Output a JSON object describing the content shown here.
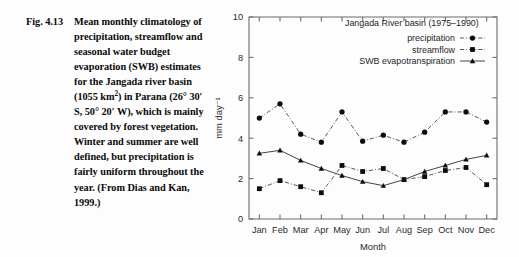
{
  "caption": {
    "figure_number": "Fig. 4.13",
    "text_html": "Mean monthly climatology of precipitation, streamflow and seasonal water budget evaporation (SWB) estimates for the Jangada river basin (1055 km<sup>2</sup>) in Parana (26° 30′ S, 50° 20′ W), which is mainly covered by forest vegetation. Winter and summer are well defined, but precipitation is fairly uniform throughout the year. (From Dias and Kan, 1999.)",
    "text_plain": "Mean monthly climatology of precipitation, streamflow and seasonal water budget evaporation (SWB) estimates for the Jangada river basin (1055 km2) in Parana (26° 30′ S, 50° 20′ W), which is mainly covered by forest vegetation. Winter and summer are well defined, but precipitation is fairly uniform throughout the year. (From Dias and Kan, 1999.)"
  },
  "chart_data": {
    "type": "line",
    "title": "Jangada River basin (1975–1990)",
    "xlabel": "Month",
    "ylabel": "mm day⁻¹",
    "categories": [
      "Jan",
      "Feb",
      "Mar",
      "Apr",
      "May",
      "Jun",
      "Jul",
      "Aug",
      "Sep",
      "Oct",
      "Nov",
      "Dec"
    ],
    "ylim": [
      0,
      10
    ],
    "yticks": [
      0,
      2,
      4,
      6,
      8,
      10
    ],
    "yticklabels": [
      "0",
      "2",
      "4",
      "6",
      "8",
      "10"
    ],
    "grid": false,
    "legend_position": "top-right",
    "series": [
      {
        "name": "precipitation",
        "marker": "circle",
        "linestyle": "dash-dot",
        "color": "#0d0d0d",
        "values": [
          5.0,
          5.7,
          4.2,
          3.8,
          5.3,
          3.85,
          4.15,
          3.8,
          4.3,
          5.3,
          5.3,
          4.8
        ]
      },
      {
        "name": "streamflow",
        "marker": "square",
        "linestyle": "dash-dot",
        "color": "#0d0d0d",
        "values": [
          1.5,
          1.9,
          1.6,
          1.3,
          2.65,
          2.35,
          2.5,
          1.95,
          2.1,
          2.4,
          2.55,
          1.7
        ]
      },
      {
        "name": "SWB evapotranspiration",
        "marker": "triangle",
        "linestyle": "solid",
        "color": "#0d0d0d",
        "values": [
          3.25,
          3.4,
          2.9,
          2.5,
          2.15,
          1.85,
          1.65,
          1.95,
          2.35,
          2.65,
          2.95,
          3.15
        ]
      }
    ]
  }
}
